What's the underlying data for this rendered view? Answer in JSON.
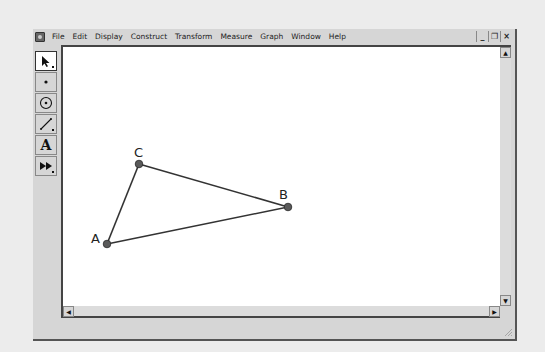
{
  "window": {
    "menu": [
      "File",
      "Edit",
      "Display",
      "Construct",
      "Transform",
      "Measure",
      "Graph",
      "Window",
      "Help"
    ],
    "controls": {
      "minimize": "_",
      "restore": "❐",
      "close": "×"
    }
  },
  "toolbar": {
    "tools": [
      {
        "name": "arrow-tool",
        "glyph": "➚",
        "selected": true
      },
      {
        "name": "point-tool",
        "glyph": "•",
        "selected": false
      },
      {
        "name": "compass-tool",
        "glyph": "⊙",
        "selected": false
      },
      {
        "name": "straightedge-tool",
        "glyph": "╱",
        "selected": false
      },
      {
        "name": "text-tool",
        "glyph": "A",
        "selected": false
      },
      {
        "name": "custom-tool",
        "glyph": "▶▶",
        "selected": false
      }
    ]
  },
  "scrollbars": {
    "up_arrow": "▲",
    "down_arrow": "▼",
    "left_arrow": "◀",
    "right_arrow": "▶"
  },
  "sketch": {
    "points": [
      {
        "label": "A",
        "x": 107,
        "y": 244
      },
      {
        "label": "B",
        "x": 288,
        "y": 207
      },
      {
        "label": "C",
        "x": 139,
        "y": 164
      }
    ],
    "segments": [
      [
        "A",
        "C"
      ],
      [
        "C",
        "B"
      ],
      [
        "A",
        "B"
      ]
    ],
    "colors": {
      "point_fill": "#5a5a5a",
      "point_stroke": "#2a2a2a",
      "segment": "#333333"
    }
  }
}
